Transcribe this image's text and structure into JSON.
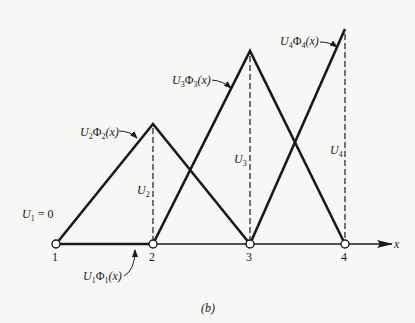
{
  "figure": {
    "caption": "(b)",
    "axis_label": "x",
    "nodes": [
      "1",
      "2",
      "3",
      "4"
    ],
    "u1_value_label": {
      "main": "U",
      "sub": "1",
      "rest": " = 0"
    },
    "height_labels": [
      {
        "main": "U",
        "sub": "2"
      },
      {
        "main": "U",
        "sub": "3"
      },
      {
        "main": "U",
        "sub": "4"
      }
    ],
    "function_labels": [
      {
        "id": "phi1",
        "U": "U",
        "Usub": "1",
        "Phi": "Φ",
        "Phisub": "1",
        "arg": "(x)"
      },
      {
        "id": "phi2",
        "U": "U",
        "Usub": "2",
        "Phi": "Φ",
        "Phisub": "2",
        "arg": "(x)"
      },
      {
        "id": "phi3",
        "U": "U",
        "Usub": "3",
        "Phi": "Φ",
        "Phisub": "3",
        "arg": "(x)"
      },
      {
        "id": "phi4",
        "U": "U",
        "Usub": "4",
        "Phi": "Φ",
        "Phisub": "4",
        "arg": "(x)"
      }
    ],
    "colors": {
      "ink": "#1a1a1a",
      "paper": "#f7f7f5"
    }
  }
}
